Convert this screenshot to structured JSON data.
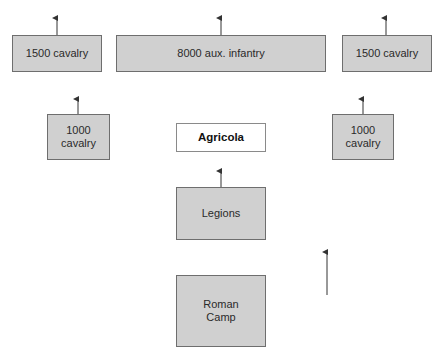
{
  "diagram": {
    "colors": {
      "box_fill": "#d0d0d0",
      "box_border": "#6e6e6e",
      "commander_fill": "#ffffff",
      "arrow": "#333333"
    },
    "nodes": {
      "cavalry_left_front": "1500 cavalry",
      "aux_infantry": "8000 aux. infantry",
      "cavalry_right_front": "1500 cavalry",
      "cavalry_left_rear": "1000\ncavalry",
      "commander": "Agricola",
      "cavalry_right_rear": "1000\ncavalry",
      "legions": "Legions",
      "camp": "Roman\nCamp"
    },
    "arrows": [
      {
        "name": "advance-arrow-cavalry-left-front",
        "x": 57,
        "y1": 17,
        "y2": 35
      },
      {
        "name": "advance-arrow-aux-infantry",
        "x": 221,
        "y1": 17,
        "y2": 35
      },
      {
        "name": "advance-arrow-cavalry-right-front",
        "x": 386,
        "y1": 17,
        "y2": 35
      },
      {
        "name": "advance-arrow-cavalry-left-rear",
        "x": 78,
        "y1": 98,
        "y2": 114
      },
      {
        "name": "advance-arrow-cavalry-right-rear",
        "x": 363,
        "y1": 98,
        "y2": 114
      },
      {
        "name": "advance-arrow-legions",
        "x": 221,
        "y1": 170,
        "y2": 187
      },
      {
        "name": "advance-arrow-standalone",
        "x": 327,
        "y1": 251,
        "y2": 295
      }
    ]
  }
}
